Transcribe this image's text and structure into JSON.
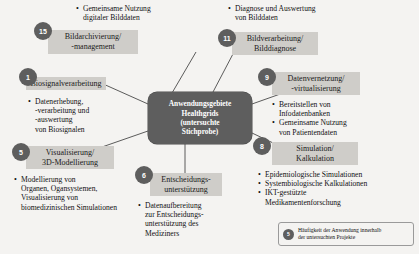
{
  "figure": {
    "center": {
      "line1": "Anwendungsgebiete",
      "line2": "Healthgrids",
      "line3": "(untersuchte",
      "line4": "Stichprobe)"
    },
    "colors": {
      "node_fill": "#5e5e5e",
      "plate_fill": "#cfcdc9",
      "background": "#f4f3f1",
      "edge": "#4a4a4a",
      "text": "#111111",
      "node_text": "#ffffff"
    },
    "nodes": [
      {
        "id": "bildarchivierung",
        "badge": "15",
        "title_line1": "Bildarchivierung/",
        "title_line2": "-management",
        "bullets": [
          "Gemeinsame Nutzung\ndigitaler Bilddaten"
        ]
      },
      {
        "id": "biosignalverarbeitung",
        "badge": "1",
        "title_line1": "Biosignalverarbeitung",
        "title_line2": "",
        "bullets": [
          "Datenerhebung,\n-verarbeitung und\n-auswertung\nvon Biosignalen"
        ]
      },
      {
        "id": "visualisierung",
        "badge": "5",
        "title_line1": "Visualisierung/",
        "title_line2": "3D-Modellierung",
        "bullets": [
          "Modellierung von\nOrganen, Ogansystemen,\nVisualisierung von\nbiomedizinischen Simulationen"
        ]
      },
      {
        "id": "entscheidungsunterstuetzung",
        "badge": "6",
        "title_line1": "Entscheidungs-",
        "title_line2": "unterstützung",
        "bullets": [
          "Datenaufbereitung\nzur Entscheidungs-\nunterstützung des\nMediziners"
        ]
      },
      {
        "id": "bildverarbeitung",
        "badge": "11",
        "title_line1": "Bildverarbeitung/",
        "title_line2": "Bilddiagnose",
        "bullets": [
          "Diagnose und Auswertung\nvon Bilddaten"
        ]
      },
      {
        "id": "datenvernetzung",
        "badge": "9",
        "title_line1": "Datenvernetzung/",
        "title_line2": "-virtualisierung",
        "bullets": [
          "Bereitstellen von\nInfodatenbanken",
          "Gemeinsame Nutzung\nvon Patientendaten"
        ]
      },
      {
        "id": "simulation",
        "badge": "8",
        "title_line1": "Simulation/",
        "title_line2": "Kalkulation",
        "bullets": [
          "Epidemiologische Simulationen",
          "Systembiologische Kalkulationen",
          "IKT-gestützte\nMedikamentenforschung"
        ]
      }
    ],
    "legend": {
      "badge": "5",
      "text": "Häufigkeit der Anwendung innerhalb\nder untersuchten Projekte"
    }
  }
}
